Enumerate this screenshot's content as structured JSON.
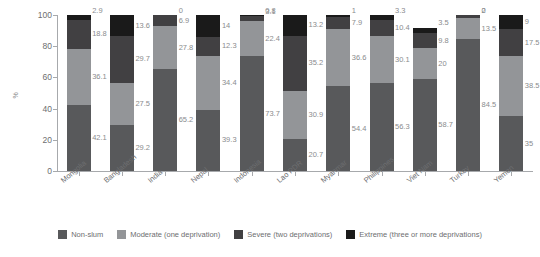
{
  "chart_data": {
    "type": "bar",
    "subtype": "stacked-bar-100",
    "title": "",
    "xlabel": "",
    "ylabel": "%",
    "ylim": [
      0,
      100
    ],
    "yticks": [
      0,
      20,
      40,
      60,
      80,
      100
    ],
    "grid": false,
    "legend_position": "bottom",
    "categories": [
      "Mongolia",
      "Bangladesh",
      "India",
      "Nepal",
      "Indonesia",
      "Lao PDR",
      "Myanmar",
      "Philippines",
      "Viet Nam",
      "Turkey",
      "Yemen"
    ],
    "series": [
      {
        "name": "Non-slum",
        "color": "#58595b",
        "values": [
          42.1,
          29.2,
          65.2,
          39.3,
          73.7,
          20.7,
          54.4,
          56.3,
          58.7,
          84.5,
          35
        ]
      },
      {
        "name": "Moderate (one deprivation)",
        "color": "#939598",
        "values": [
          36.1,
          27.5,
          27.8,
          34.4,
          22.4,
          30.9,
          36.6,
          30.1,
          20,
          13.5,
          38.5
        ]
      },
      {
        "name": "Severe (two deprivations)",
        "color": "#414042",
        "values": [
          18.8,
          29.7,
          6.9,
          12.3,
          3.1,
          35.2,
          7.9,
          10.4,
          9.8,
          2,
          17.5
        ]
      },
      {
        "name": "Extreme (three or more deprivations)",
        "color": "#1a1a1a",
        "values": [
          2.9,
          13.6,
          0,
          14,
          0.8,
          13.2,
          1,
          3.3,
          3.5,
          0,
          9
        ]
      }
    ],
    "value_labels": [
      [
        "42.1",
        "36.1",
        "18.8",
        "2.9"
      ],
      [
        "29.2",
        "27.5",
        "29.7",
        "13.6"
      ],
      [
        "65.2",
        "27.8",
        "6.9",
        "0"
      ],
      [
        "39.3",
        "34.4",
        "12.3",
        "14"
      ],
      [
        "73.7",
        "22.4",
        "3.1",
        "0.8"
      ],
      [
        "20.7",
        "30.9",
        "35.2",
        "13.2"
      ],
      [
        "54.4",
        "36.6",
        "7.9",
        "1"
      ],
      [
        "56.3",
        "30.1",
        "10.4",
        "3.3"
      ],
      [
        "58.7",
        "20",
        "9.8",
        "3.5"
      ],
      [
        "84.5",
        "13.5",
        "2",
        "0"
      ],
      [
        "35",
        "38.5",
        "17.5",
        "9"
      ]
    ]
  },
  "axis": {
    "y_title": "%",
    "y_tick_labels": [
      "100",
      "80",
      "60",
      "40",
      "20",
      "0"
    ]
  },
  "legend": {
    "items": [
      {
        "label": "Non-slum",
        "color": "#58595b"
      },
      {
        "label": "Moderate (one deprivation)",
        "color": "#939598"
      },
      {
        "label": "Severe (two deprivations)",
        "color": "#414042"
      },
      {
        "label": "Extreme (three or more deprivations)",
        "color": "#1a1a1a"
      }
    ]
  }
}
